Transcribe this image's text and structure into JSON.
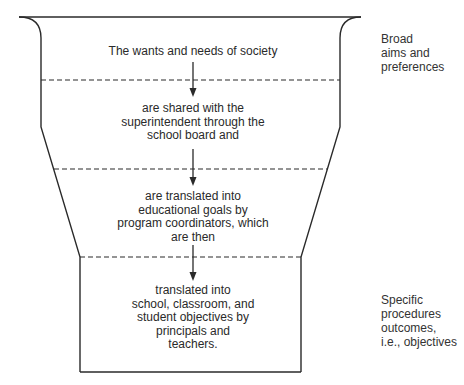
{
  "diagram": {
    "type": "funnel",
    "stages": [
      {
        "lines": [
          "The wants and needs of society"
        ]
      },
      {
        "lines": [
          "are shared with the",
          "superintendent through the",
          "school board and"
        ]
      },
      {
        "lines": [
          "are translated into",
          "educational goals by",
          "program coordinators, which",
          "are then"
        ]
      },
      {
        "lines": [
          "translated into",
          "school, classroom, and",
          "student objectives by",
          "principals and",
          "teachers."
        ]
      }
    ],
    "side_labels": {
      "top": {
        "lines": [
          "Broad",
          "aims and",
          "preferences"
        ]
      },
      "bottom": {
        "lines": [
          "Specific",
          "procedures",
          "outcomes,",
          "i.e., objectives"
        ]
      }
    },
    "colors": {
      "stroke": "#2a2a2a",
      "text": "#2a2a2a",
      "background": "#ffffff"
    }
  }
}
